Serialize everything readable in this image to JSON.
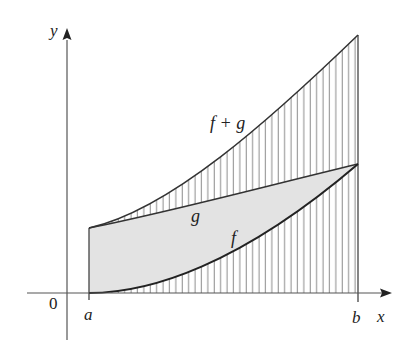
{
  "figure": {
    "type": "area-diagram",
    "axes": {
      "x_label": "x",
      "y_label": "y",
      "origin_label": "0"
    },
    "ticks": {
      "a": "a",
      "b": "b"
    },
    "curves": [
      {
        "name": "f",
        "label": "f",
        "shape": "convex increasing, starts at 0 at x=a"
      },
      {
        "name": "g",
        "label": "g",
        "shape": "gently increasing, positive at x=a"
      },
      {
        "name": "f+g",
        "label": "f + g",
        "shape": "sum curve, convex increasing"
      }
    ],
    "colors": {
      "axis": "#555555",
      "curve": "#333333",
      "shaded_fill": "#e3e3e3",
      "hatch": "#777777",
      "background": "#ffffff"
    },
    "regions": [
      {
        "name": "under-f",
        "style": "vertical hatching"
      },
      {
        "name": "between-f-and-g",
        "style": "gray fill"
      },
      {
        "name": "between-g-and-f+g",
        "style": "vertical hatching"
      }
    ]
  }
}
